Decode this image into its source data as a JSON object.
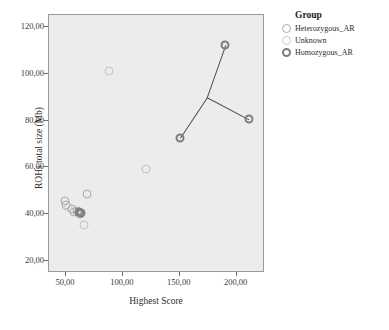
{
  "chart_data": {
    "type": "scatter",
    "title": "",
    "xlabel": "Highest Score",
    "ylabel": "ROHs total size (Mb)",
    "xlim": [
      35,
      225
    ],
    "ylim": [
      15,
      125
    ],
    "xticks": [
      "50,00",
      "100,00",
      "150,00",
      "200,00"
    ],
    "xtick_values": [
      50,
      100,
      150,
      200
    ],
    "yticks": [
      "20,00",
      "40,00",
      "60,00",
      "80,00",
      "100,00",
      "120,00"
    ],
    "ytick_values": [
      20,
      40,
      60,
      80,
      100,
      120
    ],
    "grid": false,
    "legend_position": "right",
    "series": [
      {
        "name": "Heterozygous_AR",
        "color": "#a8a8a8",
        "marker": "open-circle",
        "points": [
          {
            "x": 49,
            "y": 45.5
          },
          {
            "x": 50,
            "y": 44.0
          },
          {
            "x": 55,
            "y": 42.5
          },
          {
            "x": 57,
            "y": 41.0
          },
          {
            "x": 60,
            "y": 41.5
          },
          {
            "x": 62,
            "y": 40.0
          },
          {
            "x": 68,
            "y": 48.5
          }
        ]
      },
      {
        "name": "Unknown",
        "color": "#c2c2c2",
        "marker": "open-circle",
        "points": [
          {
            "x": 88,
            "y": 101.0
          },
          {
            "x": 120,
            "y": 59.5
          },
          {
            "x": 66,
            "y": 35.5
          },
          {
            "x": 52,
            "y": 43.0
          }
        ]
      },
      {
        "name": "Homozygous_AR",
        "color": "#7d7d7d",
        "marker": "bold-open-circle",
        "points": [
          {
            "x": 150,
            "y": 72.5
          },
          {
            "x": 190,
            "y": 112.0
          },
          {
            "x": 211,
            "y": 80.5
          },
          {
            "x": 61,
            "y": 41.0
          },
          {
            "x": 63,
            "y": 40.5
          }
        ]
      }
    ],
    "connector_lines": [
      {
        "from": [
          150,
          72.5
        ],
        "to": [
          174,
          90.0
        ]
      },
      {
        "from": [
          174,
          90.0
        ],
        "to": [
          190,
          112.0
        ]
      },
      {
        "from": [
          174,
          90.0
        ],
        "to": [
          211,
          80.5
        ]
      }
    ]
  },
  "legend": {
    "title": "Group",
    "items": [
      {
        "label": "Heterozygous_AR",
        "color": "#a8a8a8",
        "weight": "thin"
      },
      {
        "label": "Unknown",
        "color": "#c9c9c9",
        "weight": "thin"
      },
      {
        "label": "Homozygous_AR",
        "color": "#7d7d7d",
        "weight": "bold"
      }
    ]
  }
}
